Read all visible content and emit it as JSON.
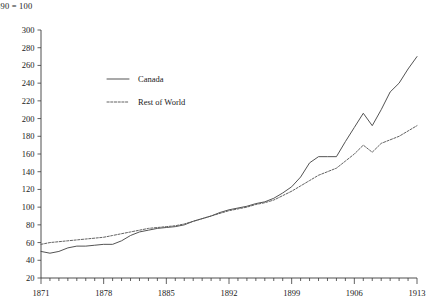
{
  "chart_data": {
    "type": "line",
    "title": "890 = 100",
    "title_full": "1890 = 100",
    "xlabel": "",
    "ylabel": "",
    "xlim": [
      1871,
      1913
    ],
    "ylim": [
      20,
      300
    ],
    "y_ticks": [
      20,
      40,
      60,
      80,
      100,
      120,
      140,
      160,
      180,
      200,
      220,
      240,
      260,
      280,
      300
    ],
    "x_ticks_major": [
      1871,
      1878,
      1885,
      1892,
      1899,
      1906,
      1913
    ],
    "x_minor_tick_step": 1,
    "grid": false,
    "legend_position": "upper-left-inset",
    "x": [
      1871,
      1872,
      1873,
      1874,
      1875,
      1876,
      1877,
      1878,
      1879,
      1880,
      1881,
      1882,
      1883,
      1884,
      1885,
      1886,
      1887,
      1888,
      1889,
      1890,
      1891,
      1892,
      1893,
      1894,
      1895,
      1896,
      1897,
      1898,
      1899,
      1900,
      1901,
      1902,
      1903,
      1904,
      1905,
      1906,
      1907,
      1908,
      1909,
      1910,
      1911,
      1912,
      1913
    ],
    "series": [
      {
        "name": "Canada",
        "style": "solid",
        "color": "#4a4a4a",
        "values": [
          50,
          48,
          50,
          54,
          56,
          56,
          57,
          58,
          58,
          62,
          68,
          72,
          74,
          76,
          77,
          78,
          80,
          84,
          87,
          90,
          94,
          97,
          99,
          101,
          104,
          106,
          110,
          116,
          123,
          134,
          150,
          157,
          157,
          157,
          174,
          190,
          206,
          192,
          210,
          230,
          240,
          256,
          270
        ]
      },
      {
        "name": "Rest of World",
        "style": "dashed",
        "color": "#5a5a5a",
        "values": [
          58,
          60,
          61,
          62,
          63,
          64,
          65,
          66,
          68,
          70,
          72,
          74,
          76,
          77,
          78,
          79,
          81,
          84,
          87,
          90,
          93,
          96,
          98,
          100,
          103,
          105,
          108,
          113,
          118,
          124,
          130,
          136,
          140,
          144,
          152,
          160,
          170,
          162,
          172,
          176,
          180,
          186,
          192
        ]
      }
    ]
  },
  "legend": {
    "entries": [
      {
        "label": "Canada"
      },
      {
        "label": "Rest of World"
      }
    ]
  }
}
